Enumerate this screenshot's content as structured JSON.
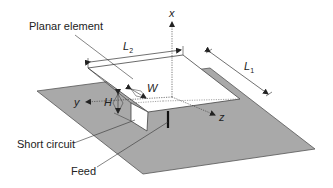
{
  "diagram": {
    "type": "planar inverted-F antenna geometry",
    "labels": {
      "planar_element": "Planar element",
      "short_circuit": "Short circuit",
      "feed": "Feed"
    },
    "dimensions": {
      "L1": {
        "base": "L",
        "sub": "1"
      },
      "L2": {
        "base": "L",
        "sub": "2"
      },
      "H": "H",
      "W": "W"
    },
    "axes": {
      "x": "x",
      "y": "y",
      "z": "z"
    },
    "colors": {
      "ground_plane": "#a9a9a9",
      "ground_outline": "#555555",
      "plate": "#ffffff",
      "lines": "#333333"
    }
  }
}
